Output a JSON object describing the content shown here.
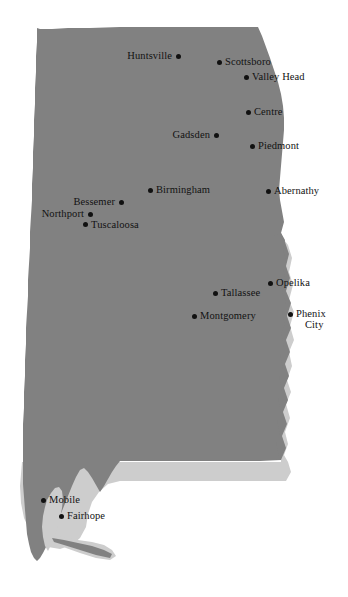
{
  "map": {
    "title": "Alabama",
    "region_label": "Alabama state outline map with cities",
    "colors": {
      "state_fill": "#818181",
      "neighbor_fill": "#cdcdcd",
      "background": "#ffffff",
      "marker": "#111111",
      "label_text": "#121212"
    },
    "cities": [
      {
        "name": "Huntsville",
        "x": 178,
        "y": 56,
        "placement": "left"
      },
      {
        "name": "Scottsboro",
        "x": 219,
        "y": 62,
        "placement": "right"
      },
      {
        "name": "Valley Head",
        "x": 246,
        "y": 77,
        "placement": "right"
      },
      {
        "name": "Centre",
        "x": 248,
        "y": 112,
        "placement": "right"
      },
      {
        "name": "Gadsden",
        "x": 216,
        "y": 135,
        "placement": "left"
      },
      {
        "name": "Piedmont",
        "x": 252,
        "y": 146,
        "placement": "right"
      },
      {
        "name": "Birmingham",
        "x": 150,
        "y": 190,
        "placement": "right"
      },
      {
        "name": "Abernathy",
        "x": 268,
        "y": 191,
        "placement": "right"
      },
      {
        "name": "Bessemer",
        "x": 121,
        "y": 202,
        "placement": "left"
      },
      {
        "name": "Northport",
        "x": 90,
        "y": 214,
        "placement": "left"
      },
      {
        "name": "Tuscaloosa",
        "x": 85,
        "y": 224,
        "placement": "rightdown"
      },
      {
        "name": "Opelika",
        "x": 270,
        "y": 283,
        "placement": "right"
      },
      {
        "name": "Tallassee",
        "x": 215,
        "y": 293,
        "placement": "right"
      },
      {
        "name": "Montgomery",
        "x": 194,
        "y": 316,
        "placement": "right"
      },
      {
        "name": "Phenix City",
        "x": 290,
        "y": 314,
        "placement": "two",
        "line1": "Phenix",
        "line2": "City"
      },
      {
        "name": "Mobile",
        "x": 43,
        "y": 500,
        "placement": "right"
      },
      {
        "name": "Fairhope",
        "x": 61,
        "y": 516,
        "placement": "right"
      }
    ]
  }
}
